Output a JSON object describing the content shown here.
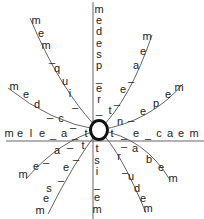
{
  "diagram": {
    "center": {
      "label": "O",
      "x": 99,
      "y": 130
    },
    "line_color": "#555555",
    "text_color": "#222222",
    "spokes": [
      {
        "name": "up",
        "letters": [
          "m",
          "e",
          "d",
          "e",
          "s",
          "p",
          "_",
          "e",
          "r",
          "_"
        ]
      },
      {
        "name": "upper-right-steep",
        "letters": [
          "m",
          "e",
          "a",
          "_",
          "e",
          "_",
          "t"
        ]
      },
      {
        "name": "upper-right-shallow",
        "letters": [
          "m",
          "e",
          "p",
          "e",
          "_",
          "n"
        ]
      },
      {
        "name": "right",
        "letters": [
          "t",
          "_",
          "e",
          "_",
          "c",
          "a",
          "e",
          "m"
        ]
      },
      {
        "name": "lower-right-shallow",
        "letters": [
          "_",
          "a",
          "b",
          "e",
          "m"
        ]
      },
      {
        "name": "lower-right-steep",
        "letters": [
          "r",
          "_",
          "u",
          "d",
          "e",
          "m"
        ]
      },
      {
        "name": "down",
        "letters": [
          "t",
          "s",
          "i",
          "_",
          "e",
          "m"
        ]
      },
      {
        "name": "lower-left-steep",
        "letters": [
          "_",
          "e",
          "_",
          "s",
          "e",
          "m"
        ]
      },
      {
        "name": "lower-left-shallow",
        "letters": [
          "t",
          "_",
          "a",
          "e",
          "m"
        ]
      },
      {
        "name": "left",
        "letters": [
          "m",
          "e",
          "l",
          "e",
          "_",
          "a",
          "_",
          "t"
        ]
      },
      {
        "name": "upper-left-shallow",
        "letters": [
          "m",
          "e",
          "d",
          "_",
          "c",
          "_"
        ]
      },
      {
        "name": "upper-left-steep",
        "letters": [
          "m",
          "e",
          "m",
          "_",
          "q",
          "u",
          "i",
          "_"
        ]
      }
    ],
    "glyphs": [
      {
        "t": "m",
        "x": 99,
        "y": 9
      },
      {
        "t": "e",
        "x": 99,
        "y": 20
      },
      {
        "t": "d",
        "x": 99,
        "y": 31
      },
      {
        "t": "e",
        "x": 99,
        "y": 43
      },
      {
        "t": "s",
        "x": 99,
        "y": 54
      },
      {
        "t": "p",
        "x": 99,
        "y": 65
      },
      {
        "t": "_",
        "x": 99,
        "y": 78
      },
      {
        "t": "e",
        "x": 99,
        "y": 88
      },
      {
        "t": "r",
        "x": 99,
        "y": 99
      },
      {
        "t": "_",
        "x": 99,
        "y": 110
      },
      {
        "t": "m",
        "x": 147,
        "y": 36
      },
      {
        "t": "e",
        "x": 143,
        "y": 51
      },
      {
        "t": "a",
        "x": 136,
        "y": 65
      },
      {
        "t": "_",
        "x": 131,
        "y": 77
      },
      {
        "t": "e",
        "x": 123,
        "y": 89
      },
      {
        "t": "_",
        "x": 117,
        "y": 100
      },
      {
        "t": "t",
        "x": 110,
        "y": 110
      },
      {
        "t": "m",
        "x": 179,
        "y": 87
      },
      {
        "t": "e",
        "x": 168,
        "y": 94
      },
      {
        "t": "p",
        "x": 156,
        "y": 103
      },
      {
        "t": "e",
        "x": 143,
        "y": 111
      },
      {
        "t": "_",
        "x": 131,
        "y": 116
      },
      {
        "t": "n",
        "x": 120,
        "y": 121
      },
      {
        "t": "t",
        "x": 112,
        "y": 133
      },
      {
        "t": "_",
        "x": 124,
        "y": 134
      },
      {
        "t": "e",
        "x": 136,
        "y": 133
      },
      {
        "t": "_",
        "x": 148,
        "y": 134
      },
      {
        "t": "c",
        "x": 159,
        "y": 133
      },
      {
        "t": "a",
        "x": 170,
        "y": 133
      },
      {
        "t": "e",
        "x": 181,
        "y": 133
      },
      {
        "t": "m",
        "x": 194,
        "y": 133
      },
      {
        "t": "_",
        "x": 124,
        "y": 142
      },
      {
        "t": "a",
        "x": 135,
        "y": 148
      },
      {
        "t": "b",
        "x": 149,
        "y": 159
      },
      {
        "t": "e",
        "x": 161,
        "y": 167
      },
      {
        "t": "m",
        "x": 173,
        "y": 178
      },
      {
        "t": "r",
        "x": 119,
        "y": 156
      },
      {
        "t": "_",
        "x": 125,
        "y": 168
      },
      {
        "t": "u",
        "x": 131,
        "y": 176
      },
      {
        "t": "d",
        "x": 137,
        "y": 188
      },
      {
        "t": "e",
        "x": 143,
        "y": 198
      },
      {
        "t": "m",
        "x": 148,
        "y": 208
      },
      {
        "t": "t",
        "x": 97,
        "y": 148
      },
      {
        "t": "s",
        "x": 97,
        "y": 160
      },
      {
        "t": "i",
        "x": 97,
        "y": 171
      },
      {
        "t": "_",
        "x": 97,
        "y": 184
      },
      {
        "t": "e",
        "x": 97,
        "y": 197
      },
      {
        "t": "m",
        "x": 97,
        "y": 209
      },
      {
        "t": "t",
        "x": 83,
        "y": 145
      },
      {
        "t": "_",
        "x": 76,
        "y": 155
      },
      {
        "t": "e",
        "x": 66,
        "y": 167
      },
      {
        "t": "_",
        "x": 61,
        "y": 176
      },
      {
        "t": "s",
        "x": 49,
        "y": 188
      },
      {
        "t": "e",
        "x": 46,
        "y": 198
      },
      {
        "t": "m",
        "x": 40,
        "y": 210
      },
      {
        "t": "_",
        "x": 70,
        "y": 143
      },
      {
        "t": "a",
        "x": 57,
        "y": 150
      },
      {
        "t": "_",
        "x": 46,
        "y": 158
      },
      {
        "t": "e",
        "x": 36,
        "y": 166
      },
      {
        "t": "m",
        "x": 23,
        "y": 174
      },
      {
        "t": "m",
        "x": 9,
        "y": 133
      },
      {
        "t": "e",
        "x": 20,
        "y": 133
      },
      {
        "t": "l",
        "x": 31,
        "y": 133
      },
      {
        "t": "e",
        "x": 42,
        "y": 133
      },
      {
        "t": "_",
        "x": 53,
        "y": 134
      },
      {
        "t": "a",
        "x": 64,
        "y": 133
      },
      {
        "t": "_",
        "x": 75,
        "y": 134
      },
      {
        "t": "t",
        "x": 86,
        "y": 133
      },
      {
        "t": "m",
        "x": 14,
        "y": 86
      },
      {
        "t": "e",
        "x": 26,
        "y": 94
      },
      {
        "t": "d",
        "x": 37,
        "y": 104
      },
      {
        "t": "_",
        "x": 50,
        "y": 113
      },
      {
        "t": "c",
        "x": 61,
        "y": 118
      },
      {
        "t": "_",
        "x": 73,
        "y": 123
      },
      {
        "t": "m",
        "x": 36,
        "y": 20
      },
      {
        "t": "e",
        "x": 41,
        "y": 33
      },
      {
        "t": "m",
        "x": 46,
        "y": 45
      },
      {
        "t": "_",
        "x": 52,
        "y": 58
      },
      {
        "t": "q",
        "x": 57,
        "y": 68
      },
      {
        "t": "u",
        "x": 65,
        "y": 81
      },
      {
        "t": "i",
        "x": 70,
        "y": 93
      },
      {
        "t": "_",
        "x": 75,
        "y": 103
      }
    ]
  }
}
